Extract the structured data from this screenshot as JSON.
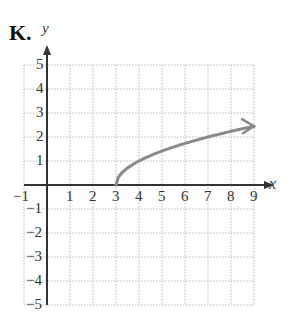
{
  "label": "K.",
  "chart_data": {
    "type": "line",
    "title": "K.",
    "xlabel": "x",
    "ylabel": "y",
    "xlim": [
      -1,
      9
    ],
    "ylim": [
      -5,
      5
    ],
    "x_ticks": [
      "-1",
      "1",
      "2",
      "3",
      "4",
      "5",
      "6",
      "7",
      "8",
      "9"
    ],
    "y_ticks": [
      "5",
      "4",
      "3",
      "2",
      "1",
      "-1",
      "-2",
      "-3",
      "-4",
      "-5"
    ],
    "grid": true,
    "series": [
      {
        "name": "y = sqrt(x - 3)",
        "color": "#8a8a8a",
        "x": [
          3,
          3.25,
          4,
          5,
          6,
          7,
          8,
          9
        ],
        "values": [
          0,
          0.5,
          1,
          1.41,
          1.73,
          2,
          2.24,
          2.45
        ],
        "start_point": [
          3,
          0
        ],
        "end_arrow": true
      }
    ]
  }
}
